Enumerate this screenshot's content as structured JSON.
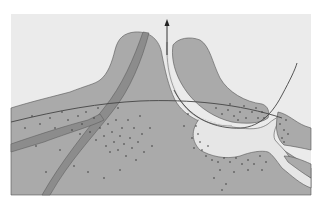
{
  "diagram": {
    "type": "cross-section-illustration",
    "labels": [],
    "colors": {
      "background": "#ffffff",
      "panel": "#ebebeb",
      "tissue": "#aaaaaa",
      "band": "#8c8c8c",
      "outline": "#555555",
      "line": "#444444",
      "cavity": "#e6e6e6",
      "dots": "#3a3a3a"
    },
    "elements": [
      {
        "name": "left-mound",
        "desc": "large gray mound rising to a peak at center-left"
      },
      {
        "name": "diagonal-band-primary",
        "desc": "dark band running from peak down to bottom-left"
      },
      {
        "name": "diagonal-band-secondary",
        "desc": "dark band running from mid-left edge toward center"
      },
      {
        "name": "right-lobe",
        "desc": "gray lobe to the right of the arrow channel"
      },
      {
        "name": "channel-arrow",
        "desc": "narrow light channel ending in an upward arrow"
      },
      {
        "name": "curved-line-horizontal",
        "desc": "thin line arcing across the section"
      },
      {
        "name": "curved-line-u",
        "desc": "thin U-shaped line on the right rising to top-right"
      },
      {
        "name": "cavity",
        "desc": "light cavity region at lower right"
      },
      {
        "name": "dot-clusters",
        "desc": "stippled dots concentrated near band crossing and cavity walls"
      }
    ]
  }
}
